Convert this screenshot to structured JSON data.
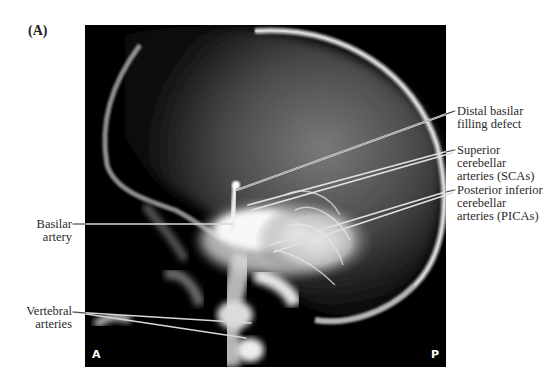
{
  "figure": {
    "panel_letter": "(A)",
    "image_description": "Lateral vertebral angiogram of the skull showing posterior circulation",
    "orientation": {
      "anterior": "A",
      "posterior": "P"
    }
  },
  "labels": {
    "left": [
      {
        "id": "basilar-artery",
        "lines": [
          "Basilar",
          "artery"
        ]
      },
      {
        "id": "vertebral-arteries",
        "lines": [
          "Vertebral",
          "arteries"
        ]
      }
    ],
    "right": [
      {
        "id": "distal-basilar-filling-defect",
        "lines": [
          "Distal basilar",
          "filling defect"
        ]
      },
      {
        "id": "superior-cerebellar-arteries",
        "lines": [
          "Superior",
          "cerebellar",
          "arteries (SCAs)"
        ]
      },
      {
        "id": "posterior-inferior-cerebellar-arteries",
        "lines": [
          "Posterior inferior",
          "cerebellar",
          "arteries (PICAs)"
        ]
      }
    ]
  },
  "colors": {
    "background": "#ffffff",
    "xray_background": "#000000",
    "leader_line": "#d9d9d9",
    "text": "#2a2a2a"
  }
}
